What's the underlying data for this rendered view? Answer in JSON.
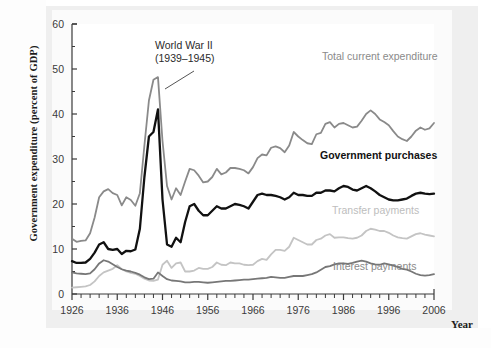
{
  "figure": {
    "y_axis_title": "Government expenditure (percent of GDP)",
    "x_axis_title": "Year"
  },
  "annotations": {
    "ww2_line1": "World War II",
    "ww2_line2": "(1939–1945)"
  },
  "series_labels": {
    "total": "Total current expenditure",
    "purchases": "Government purchases",
    "transfer": "Transfer payments",
    "interest": "Interest payments"
  },
  "colors": {
    "total": "#8a8a8a",
    "purchases": "#111111",
    "transfer": "#c4c4c4",
    "interest": "#777777",
    "axis": "#3a3a3a",
    "plot_background": "#ffffff",
    "panel_background": "#efefef"
  },
  "chart_data": {
    "type": "line",
    "title": "",
    "xlabel": "Year",
    "ylabel": "Government expenditure (percent of GDP)",
    "xlim": [
      1926,
      2006
    ],
    "ylim": [
      0,
      60
    ],
    "yticks": [
      0,
      10,
      20,
      30,
      40,
      50,
      60
    ],
    "xticks": [
      1926,
      1936,
      1946,
      1956,
      1966,
      1976,
      1986,
      1996,
      2006
    ],
    "x_minor_tick_step": 2,
    "grid": false,
    "legend": "inline-labels",
    "annotations": [
      {
        "text": "World War II (1939–1945)",
        "points_to_year": 1944,
        "points_to_value": 48
      }
    ],
    "x": [
      1926,
      1927,
      1928,
      1929,
      1930,
      1931,
      1932,
      1933,
      1934,
      1935,
      1936,
      1937,
      1938,
      1939,
      1940,
      1941,
      1942,
      1943,
      1944,
      1945,
      1946,
      1947,
      1948,
      1949,
      1950,
      1951,
      1952,
      1953,
      1954,
      1955,
      1956,
      1957,
      1958,
      1959,
      1960,
      1961,
      1962,
      1963,
      1964,
      1965,
      1966,
      1967,
      1968,
      1969,
      1970,
      1971,
      1972,
      1973,
      1974,
      1975,
      1976,
      1977,
      1978,
      1979,
      1980,
      1981,
      1982,
      1983,
      1984,
      1985,
      1986,
      1987,
      1988,
      1989,
      1990,
      1991,
      1992,
      1993,
      1994,
      1995,
      1996,
      1997,
      1998,
      1999,
      2000,
      2001,
      2002,
      2003,
      2004,
      2005,
      2006
    ],
    "series": [
      {
        "name": "Total current expenditure",
        "color": "#8a8a8a",
        "values": [
          12.3,
          11.6,
          11.8,
          11.9,
          13.5,
          17.0,
          21.5,
          22.8,
          23.3,
          22.4,
          22.0,
          19.7,
          21.5,
          20.9,
          19.6,
          22.4,
          33.0,
          43.0,
          47.6,
          48.2,
          34.0,
          24.0,
          21.0,
          23.5,
          22.0,
          25.0,
          27.8,
          27.5,
          26.3,
          24.8,
          25.0,
          26.0,
          27.8,
          26.6,
          27.0,
          28.0,
          28.0,
          27.8,
          27.5,
          26.8,
          28.2,
          30.2,
          31.0,
          30.8,
          32.5,
          32.8,
          32.4,
          31.5,
          33.0,
          36.0,
          35.0,
          34.2,
          33.5,
          33.3,
          35.5,
          35.8,
          37.8,
          38.2,
          37.0,
          37.8,
          38.0,
          37.5,
          37.0,
          37.2,
          38.5,
          40.0,
          40.8,
          40.0,
          38.8,
          38.2,
          37.5,
          36.2,
          35.0,
          34.4,
          34.0,
          35.0,
          36.3,
          37.0,
          36.5,
          36.8,
          38.0
        ]
      },
      {
        "name": "Government purchases",
        "color": "#111111",
        "values": [
          7.3,
          6.9,
          6.9,
          7.0,
          7.8,
          9.2,
          11.0,
          11.5,
          10.0,
          9.8,
          10.0,
          8.9,
          9.6,
          9.5,
          9.9,
          14.5,
          26.0,
          35.0,
          36.0,
          41.0,
          21.0,
          11.0,
          10.5,
          12.5,
          11.5,
          16.0,
          19.5,
          20.0,
          18.5,
          17.5,
          17.5,
          18.5,
          19.5,
          19.0,
          19.0,
          19.5,
          20.0,
          19.8,
          19.5,
          19.0,
          20.5,
          22.0,
          22.3,
          22.0,
          22.0,
          21.8,
          21.5,
          21.0,
          21.5,
          22.5,
          22.0,
          22.0,
          21.8,
          21.8,
          22.5,
          22.5,
          23.0,
          23.0,
          22.8,
          23.5,
          24.0,
          23.8,
          23.2,
          23.0,
          23.5,
          24.0,
          23.5,
          22.8,
          22.0,
          21.5,
          21.0,
          20.8,
          20.8,
          21.0,
          21.2,
          21.8,
          22.3,
          22.5,
          22.3,
          22.2,
          22.3
        ]
      },
      {
        "name": "Transfer payments",
        "color": "#c4c4c4",
        "values": [
          1.4,
          1.5,
          1.6,
          1.7,
          2.0,
          2.8,
          4.0,
          4.8,
          5.2,
          5.6,
          6.4,
          5.5,
          5.0,
          4.7,
          4.5,
          4.0,
          3.4,
          3.0,
          2.9,
          3.2,
          6.5,
          7.4,
          5.8,
          6.8,
          7.0,
          5.0,
          5.0,
          5.2,
          5.8,
          5.6,
          5.6,
          6.0,
          7.0,
          6.5,
          6.4,
          7.0,
          6.8,
          6.8,
          6.5,
          6.4,
          6.5,
          7.3,
          7.8,
          7.6,
          8.8,
          9.8,
          9.8,
          9.6,
          10.5,
          12.5,
          12.0,
          11.5,
          11.0,
          11.0,
          12.0,
          12.3,
          13.0,
          13.3,
          12.5,
          12.6,
          12.6,
          12.4,
          12.3,
          12.5,
          13.0,
          14.0,
          14.5,
          14.3,
          14.0,
          14.0,
          13.6,
          13.0,
          12.6,
          12.4,
          12.3,
          12.8,
          13.3,
          13.5,
          13.2,
          13.0,
          12.8
        ]
      },
      {
        "name": "Interest payments",
        "color": "#777777",
        "values": [
          4.8,
          4.6,
          4.5,
          4.4,
          4.6,
          5.5,
          6.8,
          7.5,
          7.2,
          6.6,
          6.0,
          5.5,
          5.2,
          5.0,
          4.7,
          4.3,
          3.7,
          3.3,
          3.4,
          4.8,
          4.0,
          3.3,
          3.0,
          2.9,
          2.8,
          2.6,
          2.6,
          2.7,
          2.7,
          2.6,
          2.5,
          2.6,
          2.7,
          2.8,
          2.9,
          2.9,
          3.0,
          3.1,
          3.2,
          3.2,
          3.3,
          3.4,
          3.5,
          3.6,
          3.8,
          3.7,
          3.6,
          3.6,
          3.8,
          4.0,
          4.0,
          4.0,
          4.2,
          4.4,
          4.8,
          5.4,
          6.0,
          6.2,
          6.6,
          6.8,
          6.8,
          6.7,
          6.9,
          7.2,
          7.4,
          7.2,
          6.8,
          6.6,
          6.5,
          6.8,
          6.6,
          6.3,
          6.0,
          5.6,
          5.4,
          5.0,
          4.5,
          4.2,
          4.1,
          4.2,
          4.4
        ]
      }
    ]
  }
}
